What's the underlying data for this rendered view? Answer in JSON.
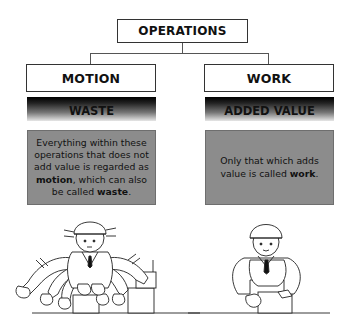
{
  "diagram": {
    "root": {
      "label": "OPERATIONS"
    },
    "branches": [
      {
        "label": "MOTION",
        "category": "WASTE",
        "description_parts": [
          {
            "text": "Everything within these operations that does not add value is regarded as ",
            "bold": false
          },
          {
            "text": "motion",
            "bold": true
          },
          {
            "text": ", which can also be called ",
            "bold": false
          },
          {
            "text": "waste",
            "bold": true
          },
          {
            "text": ".",
            "bold": false
          }
        ],
        "illustration": "busy-worker-many-arms"
      },
      {
        "label": "WORK",
        "category": "ADDED VALUE",
        "description_parts": [
          {
            "text": "Only that which adds value is called ",
            "bold": false
          },
          {
            "text": "work",
            "bold": true
          },
          {
            "text": ".",
            "bold": false
          }
        ],
        "illustration": "calm-worker"
      }
    ],
    "colors": {
      "box_border": "#333333",
      "description_bg": "#8c8c8c",
      "category_gradient_top": "#000000",
      "category_gradient_bottom": "#e6e6e6"
    }
  },
  "texts": {
    "root": "OPERATIONS",
    "left_label": "MOTION",
    "right_label": "WORK",
    "left_category": "WASTE",
    "right_category": "ADDED VALUE",
    "left_d1": "Everything within these operations that does not add value is regarded as ",
    "left_b1": "motion",
    "left_d2": ", which can also be called ",
    "left_b2": "waste",
    "left_d3": ".",
    "right_d1": "Only that which adds value is called ",
    "right_b1": "work",
    "right_d2": "."
  }
}
